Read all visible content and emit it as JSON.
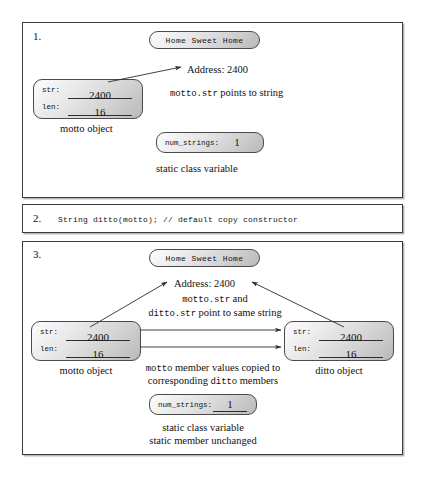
{
  "figure": {
    "type": "diagram"
  },
  "panels": [
    {
      "number": "1.",
      "string_literal": "Home Sweet Home",
      "address_label": "Address: 2400",
      "object": {
        "caption": "motto object",
        "fields": [
          {
            "label": "str:",
            "value": "2400"
          },
          {
            "label": "len:",
            "value": "16"
          }
        ]
      },
      "pointer_note_mono": "motto.str",
      "pointer_note_rest": " points to string",
      "static_var": {
        "label": "num_strings:",
        "value": "1",
        "caption": "static class variable"
      }
    },
    {
      "number": "2.",
      "code": "String ditto(motto); // default copy constructor"
    },
    {
      "number": "3.",
      "string_literal": "Home Sweet Home",
      "address_label": "Address: 2400",
      "share_note_line1_mono": "motto.str",
      "share_note_line1_rest": " and",
      "share_note_line2_mono": "ditto.str",
      "share_note_line2_rest": " point to same string",
      "left_object": {
        "caption": "motto object",
        "fields": [
          {
            "label": "str:",
            "value": "2400"
          },
          {
            "label": "len:",
            "value": "16"
          }
        ]
      },
      "right_object": {
        "caption": "ditto object",
        "fields": [
          {
            "label": "str:",
            "value": "2400"
          },
          {
            "label": "len:",
            "value": "16"
          }
        ]
      },
      "copy_note_line1_mono": "motto",
      "copy_note_line1_rest": " member values copied to",
      "copy_note_line2_pre": "corresponding ",
      "copy_note_line2_mono": "ditto",
      "copy_note_line2_post": " members",
      "static_var": {
        "label": "num_strings:",
        "value": "1",
        "caption_line1": "static class variable",
        "caption_line2": "static member unchanged"
      }
    }
  ],
  "colors": {
    "panel_border": "#3a3a3a",
    "box_border": "#4a4a4a",
    "arrow": "#2d2d2d",
    "text": "#111111",
    "background": "#ffffff"
  }
}
